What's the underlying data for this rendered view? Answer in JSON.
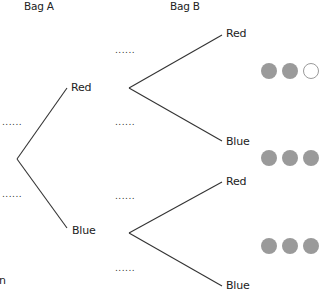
{
  "headers": {
    "bag_a": "Bag A",
    "bag_b": "Bag B"
  },
  "bag_a_branches": [
    {
      "label": "Red",
      "probability_placeholder": "......"
    },
    {
      "label": "Blue",
      "probability_placeholder": "......"
    }
  ],
  "bag_b_branches": [
    {
      "parent": "Red",
      "label": "Red",
      "probability_placeholder": "......"
    },
    {
      "parent": "Red",
      "label": "Blue",
      "probability_placeholder": "......"
    },
    {
      "parent": "Blue",
      "label": "Red",
      "probability_placeholder": "......"
    },
    {
      "parent": "Blue",
      "label": "Blue",
      "probability_placeholder": "......"
    }
  ],
  "ball_groups": [
    {
      "balls": [
        "grey",
        "grey",
        "white"
      ]
    },
    {
      "balls": [
        "grey",
        "grey",
        "grey"
      ]
    },
    {
      "balls": [
        "grey",
        "grey",
        "grey"
      ]
    }
  ],
  "footer_fragment": "n",
  "colors": {
    "line": "#333333",
    "ball_grey": "#9a9a9a",
    "ball_white": "#ffffff"
  }
}
